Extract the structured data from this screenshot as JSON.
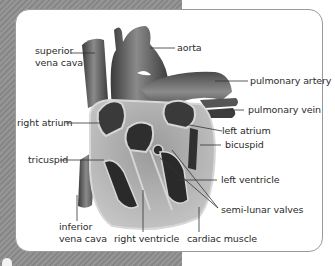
{
  "diagram": {
    "background": {
      "stripe_color": "#8e8e8e",
      "panel_color": "#ffffff",
      "border_color": "#9a9a9a"
    },
    "labels": {
      "superior_vena_cava_1": "superior",
      "superior_vena_cava_2": "vena cava",
      "aorta": "aorta",
      "pulmonary_artery": "pulmonary artery",
      "pulmonary_vein": "pulmonary vein",
      "right_atrium": "right atrium",
      "left_atrium": "left atrium",
      "bicuspid": "bicuspid",
      "tricuspid": "tricuspid",
      "left_ventricle": "left ventricle",
      "semi_lunar_valves": "semi-lunar valves",
      "inferior_vena_cava_1": "inferior",
      "inferior_vena_cava_2": "vena cava",
      "right_ventricle": "right ventricle",
      "cardiac_muscle": "cardiac muscle"
    }
  }
}
